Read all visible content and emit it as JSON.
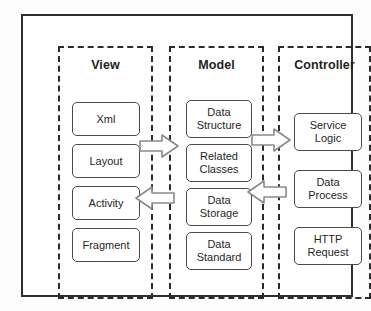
{
  "diagram": {
    "type": "block-diagram",
    "stroke_color": "#2f2f2f",
    "box_stroke_color": "#4a4a4a",
    "background": "#ffffff",
    "columns": [
      {
        "id": "view",
        "title": "View",
        "items": [
          {
            "label": "Xml"
          },
          {
            "label": "Layout"
          },
          {
            "label": "Activity"
          },
          {
            "label": "Fragment"
          }
        ]
      },
      {
        "id": "model",
        "title": "Model",
        "items": [
          {
            "label": "Data\nStructure"
          },
          {
            "label": "Related\nClasses"
          },
          {
            "label": "Data\nStorage"
          },
          {
            "label": "Data\nStandard"
          }
        ]
      },
      {
        "id": "controller",
        "title": "Controller",
        "items": [
          {
            "label": "Service\nLogic"
          },
          {
            "label": "Data\nProcess"
          },
          {
            "label": "HTTP\nRequest"
          }
        ]
      }
    ],
    "connectors": [
      {
        "id": "view-to-model",
        "from": "view",
        "to": "model",
        "direction": "right"
      },
      {
        "id": "model-to-view",
        "from": "model",
        "to": "view",
        "direction": "left"
      },
      {
        "id": "model-to-controller",
        "from": "model",
        "to": "controller",
        "direction": "right"
      },
      {
        "id": "controller-to-model",
        "from": "controller",
        "to": "model",
        "direction": "left"
      }
    ]
  }
}
